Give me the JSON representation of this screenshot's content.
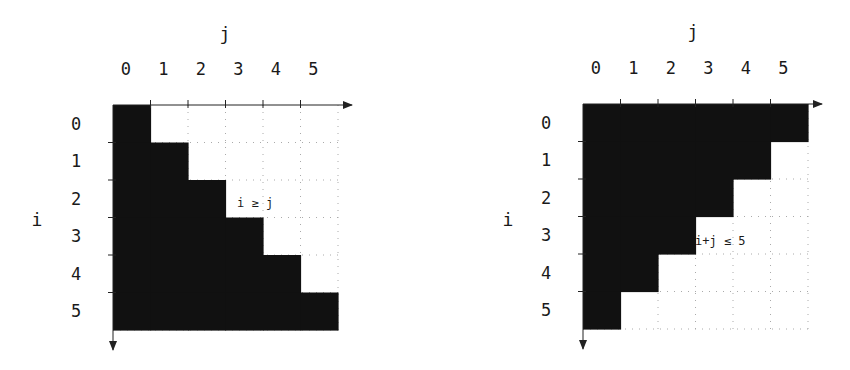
{
  "panels": [
    {
      "id": "lower-triangle",
      "axis_x_label": "j",
      "axis_y_label": "i",
      "col_labels": [
        "0",
        "1",
        "2",
        "3",
        "4",
        "5"
      ],
      "row_labels": [
        "0",
        "1",
        "2",
        "3",
        "4",
        "5"
      ],
      "condition_label": "i ≥ j",
      "filled_rule": "i >= j",
      "fill_color": "#111111"
    },
    {
      "id": "anti-triangle",
      "axis_x_label": "j",
      "axis_y_label": "i",
      "col_labels": [
        "0",
        "1",
        "2",
        "3",
        "4",
        "5"
      ],
      "row_labels": [
        "0",
        "1",
        "2",
        "3",
        "4",
        "5"
      ],
      "condition_label": "i+j ≤ 5",
      "filled_rule": "i + j <= 5",
      "fill_color": "#111111"
    }
  ]
}
